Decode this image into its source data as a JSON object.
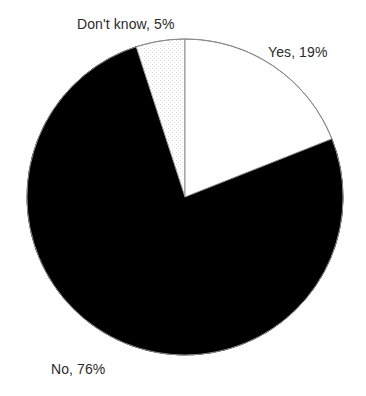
{
  "chart_data": {
    "type": "pie",
    "title": "",
    "subtitle": "",
    "xlabel": "",
    "ylabel": "",
    "legend_position": "none",
    "grid": false,
    "start_angle_deg": 0,
    "direction": "clockwise",
    "units": "percent",
    "categories": [
      "Yes",
      "No",
      "Don't know"
    ],
    "values": [
      19,
      76,
      5
    ],
    "labels": [
      "Yes, 19%",
      "No, 76%",
      "Don't know, 5%"
    ],
    "slices": [
      {
        "name": "Yes",
        "value": 19,
        "label": "Yes, 19%",
        "fill": "#ffffff",
        "stroke": "#8a8a8a",
        "pattern": "solid",
        "start_deg": 0,
        "end_deg": 68.4
      },
      {
        "name": "No",
        "value": 76,
        "label": "No, 76%",
        "fill": "#000000",
        "stroke": "#000000",
        "pattern": "solid",
        "start_deg": 68.4,
        "end_deg": 342.0
      },
      {
        "name": "Don't know",
        "value": 5,
        "label": "Don't know, 5%",
        "fill": "#fbfbfb",
        "stroke": "#9a9a9a",
        "pattern": "stipple-dots",
        "start_deg": 342.0,
        "end_deg": 360.0
      }
    ]
  },
  "colors": {
    "background": "#ffffff",
    "text": "#2b2b2b",
    "outline": "#8a8a8a",
    "slice_yes": "#ffffff",
    "slice_no": "#000000",
    "slice_dont_know": "#fbfbfb"
  },
  "labels": {
    "yes": "Yes, 19%",
    "no": "No, 76%",
    "dont_know": "Don't know, 5%"
  }
}
